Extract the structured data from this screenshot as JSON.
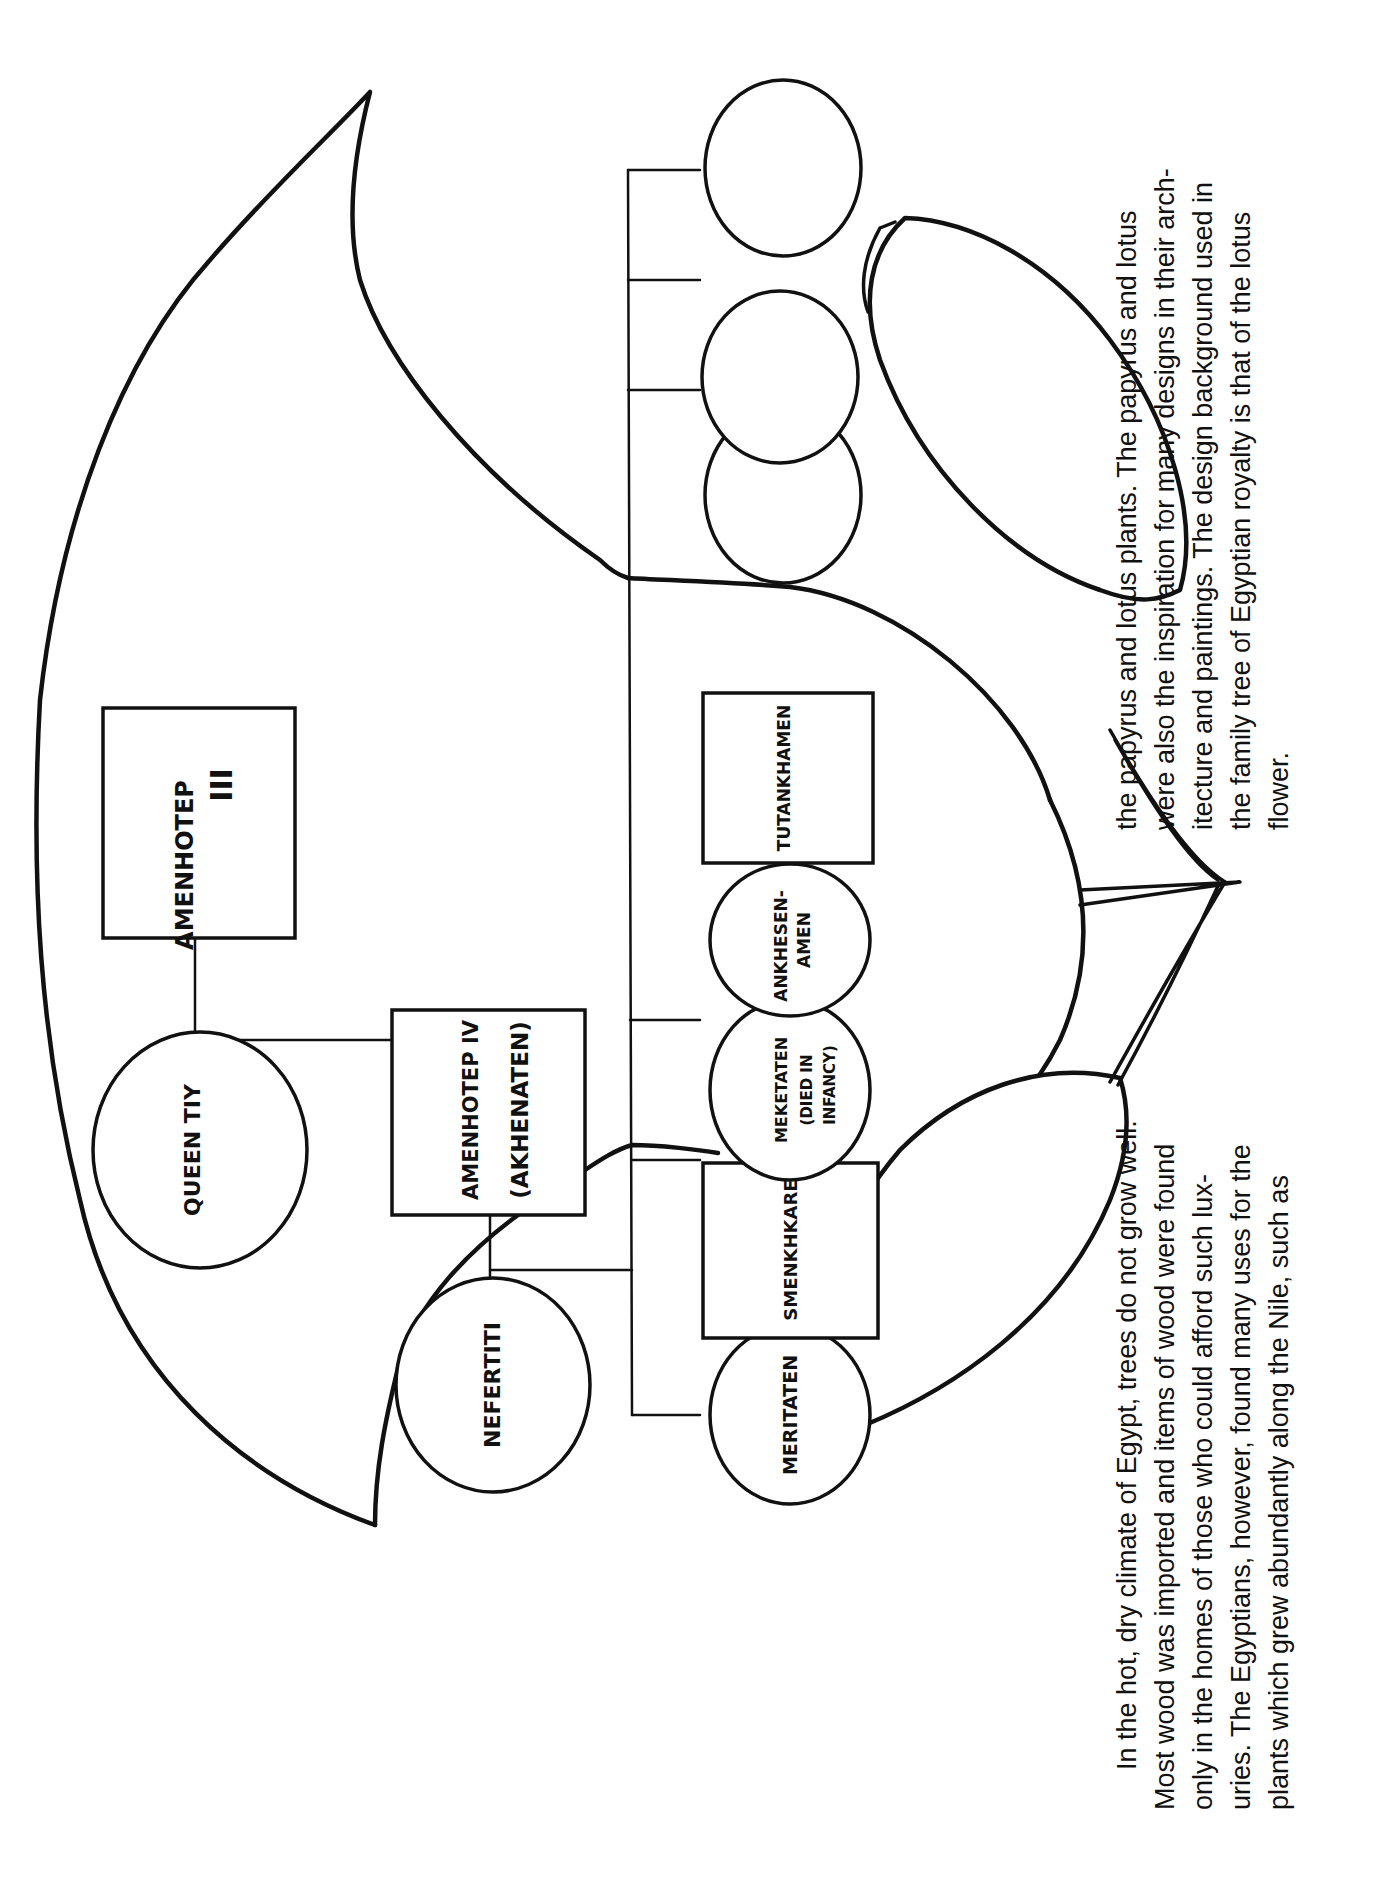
{
  "colors": {
    "ink": "#111111",
    "paper": "#ffffff"
  },
  "orientation": "rotated 90 degrees counter-clockwise",
  "tree": {
    "generation1": {
      "father": {
        "name": "AMENHOTEP",
        "numeral": "III",
        "shape": "box"
      },
      "mother": {
        "name": "QUEEN TIY",
        "shape": "circle"
      }
    },
    "generation2": {
      "husband": {
        "line1": "AMENHOTEP IV",
        "line2": "(AKHENATEN)",
        "shape": "box"
      },
      "wife": {
        "name": "NEFERTITI",
        "shape": "circle"
      }
    },
    "children": [
      {
        "name": "MERITATEN",
        "shape": "circle",
        "spouse": {
          "name": "SMENKHKARE",
          "shape": "box"
        }
      },
      {
        "line1": "MEKETATEN",
        "line2": "(DIED IN",
        "line3": "INFANCY)",
        "shape": "circle"
      },
      {
        "line1": "ANKHESEN-",
        "line2": "AMEN",
        "shape": "circle",
        "spouse": {
          "name": "TUTANKHAMEN",
          "shape": "box"
        }
      },
      {
        "name": "",
        "shape": "circle",
        "blank": true
      },
      {
        "name": "",
        "shape": "circle",
        "blank": true
      },
      {
        "name": "",
        "shape": "circle",
        "blank": true
      }
    ]
  },
  "caption": {
    "left_column": [
      "In the hot, dry climate of Egypt, trees do not grow well.",
      "Most wood was imported and items of wood were found",
      "only in the homes of those who could afford such lux-",
      "uries. The Egyptians, however, found many uses for the",
      "plants which grew abundantly along the Nile, such as"
    ],
    "right_column": [
      "the papyrus and lotus plants.  The papyrus and lotus",
      "were also the inspiration for many designs in their arch-",
      "itecture and paintings. The design background used in",
      "the family tree of Egyptian royalty is that of the lotus",
      "flower."
    ]
  }
}
